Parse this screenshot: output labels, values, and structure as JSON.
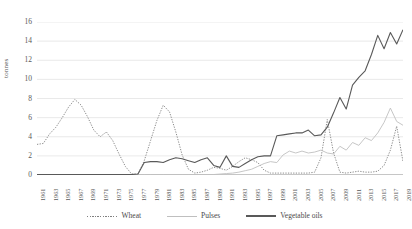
{
  "chart_data": {
    "type": "line",
    "title": "",
    "xlabel": "",
    "ylabel": "tonnes",
    "ylim": [
      0,
      16
    ],
    "ytick_values": [
      0,
      2,
      4,
      6,
      8,
      10,
      12,
      14,
      16
    ],
    "grid": true,
    "legend_position": "bottom",
    "x": [
      1961,
      1962,
      1963,
      1964,
      1965,
      1966,
      1967,
      1968,
      1969,
      1970,
      1971,
      1972,
      1973,
      1974,
      1975,
      1976,
      1977,
      1978,
      1979,
      1980,
      1981,
      1982,
      1983,
      1984,
      1985,
      1986,
      1987,
      1988,
      1989,
      1990,
      1991,
      1992,
      1993,
      1994,
      1995,
      1996,
      1997,
      1998,
      1999,
      2000,
      2001,
      2002,
      2003,
      2004,
      2005,
      2006,
      2007,
      2008,
      2009,
      2010,
      2011,
      2012,
      2013,
      2014,
      2015,
      2016,
      2017,
      2018,
      2019
    ],
    "xtick_labels": [
      "1961",
      "1963",
      "1965",
      "1967",
      "1969",
      "1971",
      "1973",
      "1975",
      "1977",
      "1979",
      "1981",
      "1983",
      "1985",
      "1987",
      "1989",
      "1991",
      "1993",
      "1995",
      "1997",
      "1999",
      "2001",
      "2003",
      "2005",
      "2007",
      "2009",
      "2011",
      "2013",
      "2015",
      "2017",
      "2019"
    ],
    "series": [
      {
        "name": "Wheat",
        "style": "dotted",
        "color": "#808080",
        "values": [
          3.2,
          3.3,
          4.3,
          5.0,
          6.0,
          7.1,
          7.9,
          7.3,
          6.1,
          4.7,
          4.0,
          4.5,
          3.6,
          2.2,
          0.9,
          0.1,
          0.1,
          1.5,
          3.6,
          5.7,
          7.3,
          6.6,
          4.5,
          2.1,
          0.6,
          0.2,
          0.3,
          0.5,
          0.8,
          0.7,
          0.5,
          0.9,
          1.4,
          1.8,
          1.6,
          1.3,
          0.5,
          0.2,
          0.2,
          0.2,
          0.2,
          0.2,
          0.2,
          0.2,
          0.3,
          1.8,
          5.8,
          2.3,
          0.3,
          0.2,
          0.3,
          0.4,
          0.3,
          0.3,
          0.4,
          1.0,
          2.6,
          5.1,
          1.4
        ]
      },
      {
        "name": "Pulses",
        "style": "solid-light",
        "color": "#bfbfbf",
        "values": [
          0.05,
          0.05,
          0.05,
          0.05,
          0.05,
          0.05,
          0.05,
          0.05,
          0.05,
          0.05,
          0.05,
          0.05,
          0.05,
          0.05,
          0.05,
          0.05,
          0.05,
          0.05,
          0.05,
          0.05,
          0.05,
          0.05,
          0.05,
          0.05,
          0.05,
          0.05,
          0.05,
          0.05,
          0.05,
          0.1,
          0.15,
          0.2,
          0.3,
          0.45,
          0.6,
          0.9,
          1.2,
          1.4,
          1.3,
          2.1,
          2.5,
          2.3,
          2.5,
          2.3,
          2.4,
          2.6,
          2.3,
          2.2,
          3.0,
          2.6,
          3.4,
          3.1,
          3.9,
          3.6,
          4.4,
          5.5,
          7.0,
          5.6,
          5.2
        ]
      },
      {
        "name": "Vegetable oils",
        "style": "solid-dark",
        "color": "#595959",
        "values": [
          0.05,
          0.05,
          0.05,
          0.05,
          0.05,
          0.05,
          0.05,
          0.05,
          0.05,
          0.05,
          0.05,
          0.05,
          0.05,
          0.05,
          0.05,
          0.05,
          0.1,
          1.3,
          1.4,
          1.4,
          1.3,
          1.6,
          1.8,
          1.7,
          1.5,
          1.3,
          1.6,
          1.8,
          1.0,
          0.8,
          2.0,
          0.9,
          0.8,
          1.2,
          1.6,
          1.9,
          2.0,
          2.0,
          4.1,
          4.2,
          4.3,
          4.4,
          4.4,
          4.7,
          4.1,
          4.2,
          5.0,
          6.5,
          8.1,
          6.9,
          9.4,
          10.2,
          10.9,
          12.6,
          14.6,
          13.2,
          14.9,
          13.7,
          15.2
        ]
      }
    ]
  },
  "legend": {
    "items": [
      {
        "label": "Wheat"
      },
      {
        "label": "Pulses"
      },
      {
        "label": "Vegetable oils"
      }
    ]
  }
}
